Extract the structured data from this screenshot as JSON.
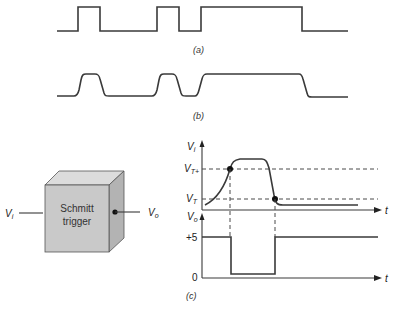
{
  "figure": {
    "captions": {
      "a": "(a)",
      "b": "(b)",
      "c": "(c)"
    },
    "waveform_a": {
      "description": "ideal square pulse train",
      "transitions": [
        "rise",
        "fall",
        "rise",
        "fall",
        "rise",
        "fall"
      ]
    },
    "waveform_b": {
      "description": "slow-edged (distorted) pulse train"
    },
    "block": {
      "line1": "Schmitt",
      "line2": "trigger",
      "input_label": "V",
      "input_sub": "i",
      "output_label": "V",
      "output_sub": "o"
    },
    "input_plot": {
      "y_label": "V",
      "y_sub": "i",
      "x_label": "t",
      "upper_threshold": {
        "label": "V",
        "sub": "T+"
      },
      "lower_threshold": {
        "label": "V",
        "sub": "T"
      }
    },
    "output_plot": {
      "y_label": "V",
      "y_sub": "o",
      "x_label": "t",
      "high_level_label": "+5",
      "low_level_label": "0"
    },
    "colors": {
      "line": "#3a3a3a",
      "cube_front": "#c9c9c9",
      "cube_top": "#dcdcdc",
      "cube_side": "#b3b3b3"
    }
  }
}
